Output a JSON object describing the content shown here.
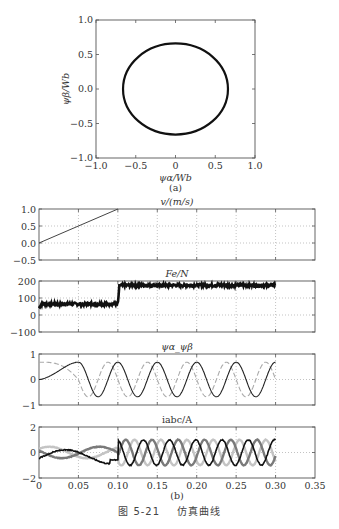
{
  "figure": {
    "caption_number": "图 5-21",
    "caption_text": "仿真曲线",
    "panel_a_label": "(a)",
    "panel_b_label": "(b)"
  },
  "colors": {
    "axis": "#555555",
    "grid": "#9a9a9a",
    "dark": "#111111",
    "mid": "#7a7a7a",
    "light": "#c4c4c4"
  },
  "chart_data": [
    {
      "id": "a",
      "type": "line",
      "title": "",
      "xlabel": "ψα/Wb",
      "ylabel": "ψβ/Wb",
      "xlim": [
        -1.0,
        1.0
      ],
      "ylim": [
        -1.0,
        1.0
      ],
      "xticks": [
        "−1.0",
        "−0.5",
        "0",
        "0.5",
        "1.0"
      ],
      "yticks": [
        "1.0",
        "0.5",
        "0.0",
        "−0.5",
        "−1.0"
      ],
      "grid": false,
      "series": [
        {
          "name": "flux locus",
          "shape": "circle",
          "radius": 0.66,
          "center": [
            0,
            0
          ]
        }
      ]
    },
    {
      "id": "v",
      "type": "line",
      "title": "v/(m/s)",
      "xlim": [
        0,
        0.35
      ],
      "ylim": [
        -0.5,
        1.0
      ],
      "yticks": [
        "1.0",
        "0.5",
        "0.0",
        "−0.5"
      ],
      "grid": true,
      "series": [
        {
          "name": "v",
          "x": [
            0,
            0.1
          ],
          "y": [
            0,
            1.0
          ]
        }
      ]
    },
    {
      "id": "F",
      "type": "line",
      "title": "Fe/N",
      "xlim": [
        0,
        0.35
      ],
      "ylim": [
        -100,
        200
      ],
      "yticks": [
        "200",
        "100",
        "0",
        "−100"
      ],
      "grid": true,
      "series": [
        {
          "name": "Fe",
          "x": [
            0,
            0.003,
            0.1,
            0.102,
            0.3
          ],
          "y": [
            40,
            65,
            65,
            175,
            175
          ],
          "ripple": 8
        }
      ]
    },
    {
      "id": "psi",
      "type": "line",
      "title": "ψα_ψβ",
      "xlim": [
        0,
        0.35
      ],
      "ylim": [
        -1,
        1
      ],
      "yticks": [
        "1",
        "0",
        "−1"
      ],
      "grid": true,
      "series": [
        {
          "name": "ψα (solid)",
          "amplitude": 0.68,
          "t_end": 0.3,
          "peaks_at": [
            0.05,
            0.1,
            0.15,
            0.2,
            0.25
          ]
        },
        {
          "name": "ψβ (dashed)",
          "amplitude": 0.68,
          "t_end": 0.3,
          "initial": 0.68
        }
      ]
    },
    {
      "id": "iabc",
      "type": "line",
      "title": "iabc/A",
      "xlabel": "",
      "xlim": [
        0,
        0.35
      ],
      "ylim": [
        -2,
        2
      ],
      "xticks": [
        "0",
        "0.05",
        "0.10",
        "0.15",
        "0.20",
        "0.25",
        "0.30",
        "0.35"
      ],
      "yticks": [
        "2",
        "0",
        "−2"
      ],
      "grid": true,
      "series": [
        {
          "name": "ia",
          "color": "dark",
          "amplitude": 1.0,
          "t_end": 0.3
        },
        {
          "name": "ib",
          "color": "mid",
          "amplitude": 1.0,
          "t_end": 0.3
        },
        {
          "name": "ic",
          "color": "light",
          "amplitude": 1.0,
          "t_end": 0.3
        }
      ]
    }
  ]
}
